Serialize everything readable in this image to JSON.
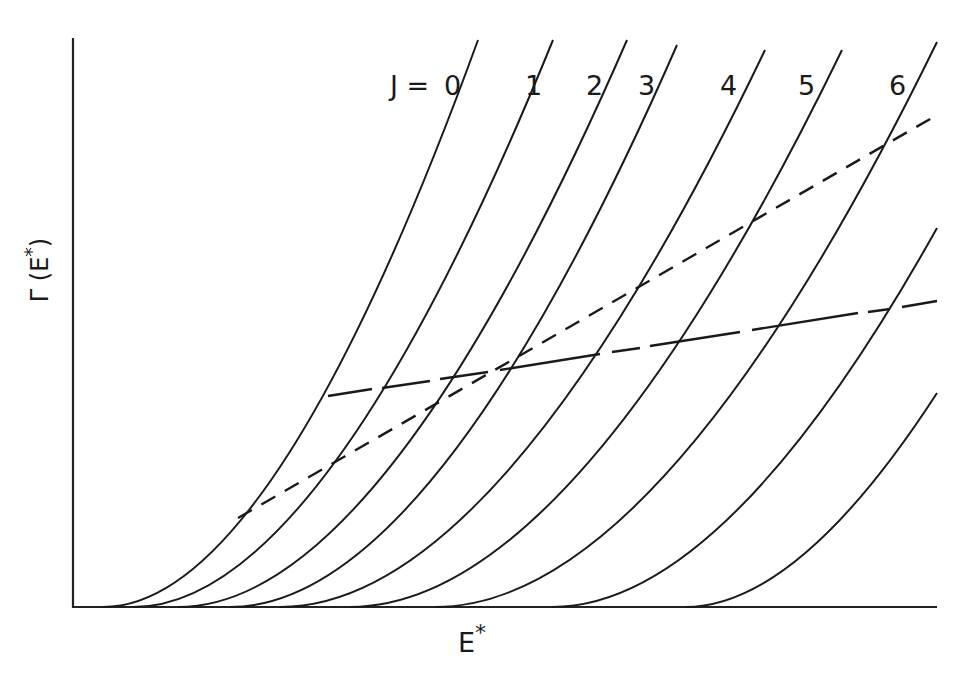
{
  "chart_data": {
    "type": "line",
    "title": "",
    "xlabel": "E*",
    "ylabel": "Γ(E*)",
    "grid": false,
    "ticks": "none",
    "legend": "inline curve labels at top",
    "curve_label_prefix": "J = ",
    "series": [
      {
        "name": "J = 0",
        "label": "0",
        "x_onset_px": 103,
        "top": [
          478,
          40
        ]
      },
      {
        "name": "J = 1",
        "label": "1",
        "x_onset_px": 133,
        "top": [
          553,
          40
        ]
      },
      {
        "name": "J = 2",
        "label": "2",
        "x_onset_px": 178,
        "top": [
          627,
          40
        ]
      },
      {
        "name": "J = 3",
        "label": "3",
        "x_onset_px": 230,
        "top": [
          677,
          45
        ]
      },
      {
        "name": "J = 4",
        "label": "4",
        "x_onset_px": 280,
        "top": [
          765,
          50
        ]
      },
      {
        "name": "J = 5",
        "label": "5",
        "x_onset_px": 350,
        "top": [
          842,
          50
        ]
      },
      {
        "name": "J = 6",
        "label": "6",
        "x_onset_px": 435,
        "top": [
          937,
          42
        ]
      },
      {
        "name": "J = 7 (unlabeled)",
        "label": "",
        "x_onset_px": 552,
        "top": [
          937,
          228
        ]
      },
      {
        "name": "J = 8 (unlabeled)",
        "label": "",
        "x_onset_px": 685,
        "top": [
          937,
          393
        ]
      }
    ],
    "overlay_lines": [
      {
        "name": "long-dash line",
        "style": "long-dash",
        "from": [
          328,
          396
        ],
        "to": [
          937,
          300
        ]
      },
      {
        "name": "short-dash line",
        "style": "short-dash",
        "from": [
          238,
          518
        ],
        "to": [
          937,
          115
        ]
      }
    ]
  },
  "labels": {
    "y_axis": "Γ(E*)",
    "x_axis": "E*",
    "j_prefix": "J = ",
    "j0": "0",
    "j1": "1",
    "j2": "2",
    "j3": "3",
    "j4": "4",
    "j5": "5",
    "j6": "6"
  }
}
